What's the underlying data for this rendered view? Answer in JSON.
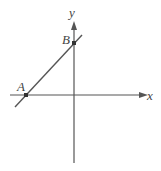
{
  "diagram": {
    "type": "coordinate-plane-line",
    "axes": {
      "x_label": "x",
      "y_label": "y"
    },
    "points": [
      {
        "name": "A",
        "label": "A",
        "on": "x-axis"
      },
      {
        "name": "B",
        "label": "B",
        "on": "y-axis"
      }
    ],
    "line": {
      "through": [
        "A",
        "B"
      ]
    },
    "colors": {
      "stroke": "#555555",
      "background": "#ffffff"
    }
  }
}
